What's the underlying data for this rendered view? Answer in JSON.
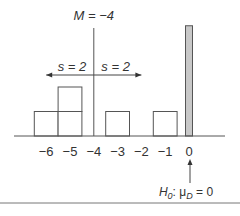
{
  "chart_data": {
    "type": "bar",
    "title": "",
    "xlabel": "",
    "ylabel": "",
    "x_ticks": [
      -6,
      -5,
      -4,
      -3,
      -2,
      -1,
      0
    ],
    "x_tick_labels": [
      "−6",
      "−5",
      "−4",
      "−3",
      "−2",
      "−1",
      "0"
    ],
    "xlim": [
      -7.2,
      1.5
    ],
    "frequency_boxes": [
      {
        "x": -6,
        "count": 1
      },
      {
        "x": -5,
        "count": 2
      },
      {
        "x": -3,
        "count": 1
      },
      {
        "x": -1,
        "count": 1
      }
    ],
    "hypothesis_bar": {
      "x": 0,
      "relative_height": 4.5,
      "color": "#c8c8c8"
    },
    "mean": {
      "value": -4,
      "label": "M = −4"
    },
    "std_dev": {
      "value": 2,
      "left_label": "s = 2",
      "right_label": "s = 2"
    },
    "annotation": {
      "text_main": "H",
      "text_sub": "0",
      "text_rest": ": μ",
      "text_sub2": "D",
      "text_tail": " = 0",
      "at_x": 0
    }
  }
}
